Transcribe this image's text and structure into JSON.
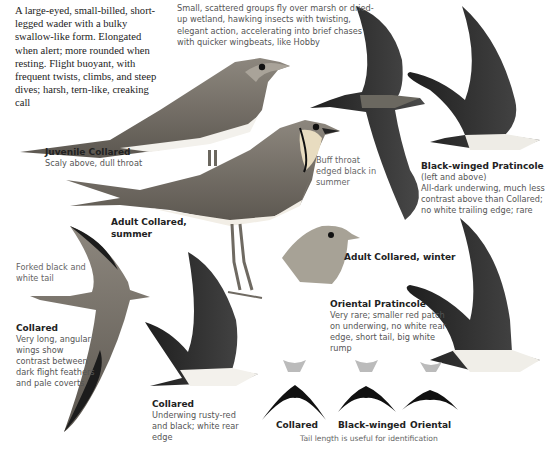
{
  "intro": "A large-eyed, small-billed, short-legged wader with a bulky swallow-like form. Elongated when alert; more rounded when resting. Flight buoyant, with frequent twists, climbs, and steep dives; harsh, tern-like, creaking call",
  "behaviour": "Small, scattered groups fly over marsh or dried-up wetland, hawking insects with twisting, elegant action, accelerating into brief chases with quicker wingbeats, like Hobby",
  "labels": {
    "juvenile": {
      "title": "Juvenile Collared",
      "desc": "Scaly above, dull throat"
    },
    "adult_summer": {
      "title": "Adult Collared, summer"
    },
    "buff_throat": "Buff throat edged black in summer",
    "adult_winter": {
      "title": "Adult Collared, winter"
    },
    "black_winged": {
      "title": "Black-winged Pratincole",
      "sub": "(left and above)",
      "desc": "All-dark underwing, much less contrast above than Collared; no white trailing edge; rare"
    },
    "forked_tail": "Forked black and white tail",
    "collared_flight": {
      "title": "Collared",
      "desc": "Very long, angular wings show contrast between dark flight feathers and pale coverts"
    },
    "oriental": {
      "title": "Oriental Pratincole",
      "desc": "Very rare; smaller red patch on underwing, no white rear edge, short tail, big white rump"
    },
    "collared_under": {
      "title": "Collared",
      "desc": "Underwing rusty-red and black; white rear edge"
    }
  },
  "tails": [
    {
      "label": "Collared"
    },
    {
      "label": "Black-winged"
    },
    {
      "label": "Oriental"
    }
  ],
  "tail_caption": "Tail length is useful for identification",
  "colors": {
    "ink": "#222222",
    "grey_text": "#555555",
    "plumage": "#8a857c",
    "dark_wing": "#2a2a2a",
    "buff": "#e8dcc0",
    "white_belly": "#f4f2ee"
  }
}
